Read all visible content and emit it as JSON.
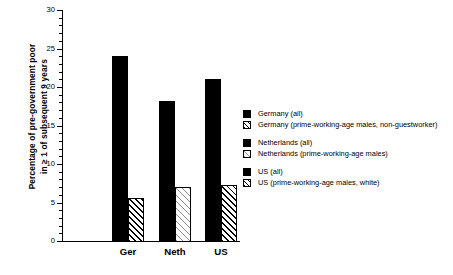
{
  "chart_data": {
    "type": "bar",
    "title": "",
    "xlabel": "",
    "ylabel": "Percentage of pre-government poor\nin ≥ 1 of subsequent 9 years",
    "ylim": [
      0,
      30
    ],
    "ytick_step_major": 5,
    "ytick_step_minor": 1,
    "ytick_labels": [
      "0",
      "5",
      "10",
      "15",
      "20",
      "25",
      "30"
    ],
    "grid": false,
    "legend_position": "right",
    "categories": [
      "Ger",
      "Neth",
      "US"
    ],
    "series": [
      {
        "name": "all",
        "values": [
          24.2,
          18.3,
          21.2
        ],
        "style": "solid"
      },
      {
        "name": "prime-working-age males",
        "values": [
          5.7,
          7.2,
          7.4
        ],
        "style": "hatched"
      }
    ],
    "bars": [
      {
        "category": "Ger",
        "label": "Germany (all)",
        "value": 24.2,
        "style": "solid"
      },
      {
        "category": "Ger",
        "label": "Germany (prime-working-age males, non-guestworker)",
        "value": 5.7,
        "style": "hatched"
      },
      {
        "category": "Neth",
        "label": "Netherlands (all)",
        "value": 18.3,
        "style": "solid"
      },
      {
        "category": "Neth",
        "label": "Netherlands (prime-working-age males)",
        "value": 7.2,
        "style": "hatched-light"
      },
      {
        "category": "US",
        "label": "US (all)",
        "value": 21.2,
        "style": "solid"
      },
      {
        "category": "US",
        "label": "US (prime-working-age males, white)",
        "value": 7.4,
        "style": "hatched"
      }
    ]
  },
  "axis": {
    "y_title_line1": "Percentage of pre-government poor",
    "y_title_line2": "in ≥ 1 of subsequent 9 years",
    "y_ticks": [
      "30",
      "25",
      "20",
      "15",
      "10",
      "5",
      "0"
    ],
    "x_ticks": [
      "Ger",
      "Neth",
      "US"
    ]
  },
  "legend": {
    "groups": [
      {
        "rows": [
          {
            "swatch": "solid",
            "label": "Germany (all)"
          },
          {
            "swatch": "hatched",
            "label": "Germany (prime-working-age males, non-guestworker)"
          }
        ]
      },
      {
        "rows": [
          {
            "swatch": "solid",
            "label": "Netherlands (all)"
          },
          {
            "swatch": "hatched-light",
            "label": "Netherlands (prime-working-age males)"
          }
        ]
      },
      {
        "rows": [
          {
            "swatch": "solid",
            "label": "US (all)"
          },
          {
            "swatch": "hatched",
            "label": "US (prime-working-age males, white)"
          }
        ]
      }
    ]
  },
  "colors": {
    "ink": "#000000",
    "background": "#ffffff",
    "hatch_light": "#8d8d8d"
  }
}
